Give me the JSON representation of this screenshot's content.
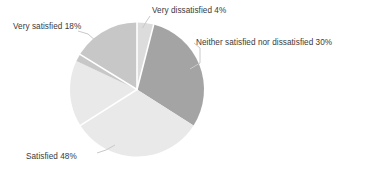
{
  "chart_data": {
    "type": "pie",
    "title": "",
    "subtitle": "",
    "xlabel": "",
    "ylabel": "",
    "legend_position": "none",
    "grid": false,
    "start_angle_deg": 0,
    "direction": "clockwise",
    "categories": [
      "Very dissatisfied",
      "Neither satisfied nor dissatisfied",
      "Satisfied",
      "Very satisfied"
    ],
    "values": [
      4,
      30,
      48,
      18
    ],
    "units": "percent",
    "slices": [
      {
        "id": "very-dissatisfied",
        "label": "Very dissatisfied",
        "value": 4,
        "value_text": "4%",
        "label_text": "Very dissatisfied 4%",
        "color": "#dcdcdc",
        "angle_deg": 14.4,
        "start_deg": 0,
        "end_deg": 14.4
      },
      {
        "id": "neither-satisfied-nor-dissatisfied",
        "label": "Neither satisfied nor dissatisfied",
        "value": 30,
        "value_text": "30%",
        "label_text": "Neither satisfied nor dissatisfied 30%",
        "color": "#a4a4a4",
        "angle_deg": 108,
        "start_deg": 14.4,
        "end_deg": 122.4
      },
      {
        "id": "satisfied",
        "label": "Satisfied",
        "value": 48,
        "value_text": "48%",
        "label_text": "Satisfied  48%",
        "color": "#e9e9e9",
        "angle_deg": 172.8,
        "start_deg": 122.4,
        "end_deg": 295.2
      },
      {
        "id": "very-satisfied",
        "label": "Very satisfied",
        "value": 18,
        "value_text": "18%",
        "label_text": "Very satisfied 18%",
        "color": "#c7c7c7",
        "angle_deg": 64.8,
        "start_deg": 295.2,
        "end_deg": 360
      }
    ],
    "colors": {
      "background": "#ffffff",
      "text": "#3a3a3a",
      "separator": "#ffffff",
      "leader_line": "#c9c9c9"
    }
  }
}
